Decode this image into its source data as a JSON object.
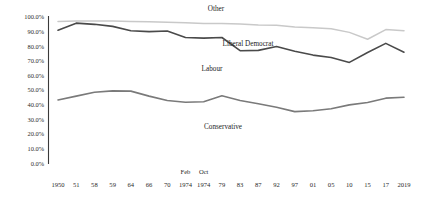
{
  "chart_data": {
    "type": "line",
    "title": "",
    "xlabel": "",
    "ylabel": "",
    "ylim": [
      0,
      100
    ],
    "ytick_labels": [
      "100.0%",
      "90.0%",
      "80.0%",
      "70.0%",
      "60.0%",
      "50.0%",
      "40.0%",
      "30.0%",
      "20.0%",
      "10.0%",
      "0.0%"
    ],
    "ytick_values": [
      100,
      90,
      80,
      70,
      60,
      50,
      40,
      30,
      20,
      10,
      0
    ],
    "categories": [
      "1950",
      "51",
      "58",
      "59",
      "64",
      "66",
      "70",
      "1974",
      "1974",
      "79",
      "83",
      "87",
      "92",
      "97",
      "01",
      "05",
      "10",
      "15",
      "17",
      "2019"
    ],
    "period_annotations": [
      {
        "label": "Feb",
        "category_index": 7
      },
      {
        "label": "Oct",
        "category_index": 8
      }
    ],
    "grid": false,
    "legend_position": "inline-annotations",
    "series": [
      {
        "name": "Other",
        "label_text": "Other",
        "color": "#c9c9c9",
        "values": [
          97.0,
          97.2,
          97.3,
          97.2,
          97.0,
          96.8,
          96.5,
          96.0,
          95.6,
          95.5,
          95.3,
          94.6,
          94.3,
          93.2,
          92.6,
          92.0,
          89.5,
          84.8,
          91.4,
          90.6
        ]
      },
      {
        "name": "Liberal Democrat",
        "label_text": "Liberal Democrat",
        "color": "#4a4a4a",
        "values": [
          91.0,
          95.8,
          95.0,
          93.6,
          90.6,
          90.0,
          90.4,
          86.0,
          85.6,
          86.0,
          77.0,
          77.2,
          79.8,
          76.6,
          74.0,
          72.4,
          69.0,
          75.8,
          82.0,
          76.0
        ]
      },
      {
        "name": "Conservative",
        "label_text": "Conservative",
        "color": "#7a7a7a",
        "values": [
          43.4,
          46.0,
          48.6,
          49.6,
          49.4,
          46.0,
          43.0,
          41.8,
          42.2,
          46.2,
          43.0,
          40.8,
          38.4,
          35.4,
          36.0,
          37.4,
          40.0,
          41.6,
          44.6,
          45.2
        ]
      }
    ],
    "series_label_positions": [
      {
        "name": "Other",
        "x": 216,
        "y": 11
      },
      {
        "name": "Liberal Democrat",
        "x": 248,
        "y": 46
      },
      {
        "name": "Labour",
        "x": 212,
        "y": 71
      },
      {
        "name": "Conservative",
        "x": 223,
        "y": 129
      }
    ],
    "extra_labels": [
      {
        "text": "Labour",
        "belongs_to": "Liberal Democrat"
      }
    ]
  }
}
